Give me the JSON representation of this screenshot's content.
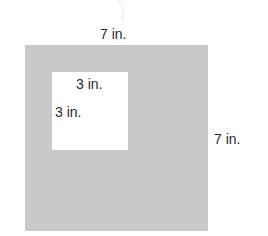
{
  "diagram": {
    "outer_square": {
      "width_label": "7 in.",
      "height_label": "7 in.",
      "color": "#c9c9c9"
    },
    "inner_square": {
      "width_label": "3 in.",
      "height_label": "3 in.",
      "color": "#ffffff"
    }
  }
}
